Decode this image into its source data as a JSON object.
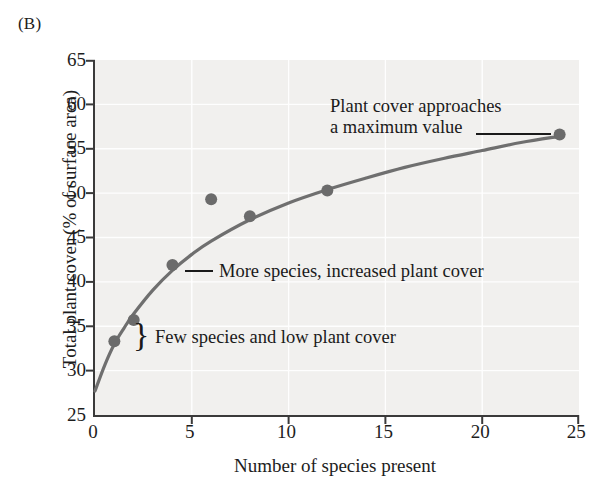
{
  "panel": {
    "label": "(B)"
  },
  "chart_data": {
    "type": "scatter",
    "title": "",
    "xlabel": "Number of species present",
    "ylabel": "Total plant cover (% of surface area)",
    "xlim": [
      0,
      25
    ],
    "ylim": [
      25,
      65
    ],
    "xticks": [
      0,
      5,
      10,
      15,
      20,
      25
    ],
    "yticks": [
      25,
      30,
      35,
      40,
      45,
      50,
      55,
      60,
      65
    ],
    "xtick_labels": [
      "0",
      "5",
      "10",
      "15",
      "20",
      "25"
    ],
    "ytick_labels": [
      "25",
      "30",
      "35",
      "40",
      "45",
      "50",
      "55",
      "60",
      "65"
    ],
    "grid": true,
    "legend": "none",
    "marker_color": "#6b6b6b",
    "line_color": "#6f6f6f",
    "plot_background": "#f1f0ee",
    "axis_color": "#3a3a3a",
    "points": [
      {
        "x": 1,
        "y": 33.3
      },
      {
        "x": 2,
        "y": 35.7
      },
      {
        "x": 4,
        "y": 41.9
      },
      {
        "x": 6,
        "y": 49.3
      },
      {
        "x": 8,
        "y": 47.4
      },
      {
        "x": 12,
        "y": 50.3
      },
      {
        "x": 24,
        "y": 56.6
      }
    ],
    "fit_curve": {
      "description": "saturating asymptotic curve through the data",
      "points": [
        {
          "x": 0.0,
          "y": 27.7
        },
        {
          "x": 0.5,
          "y": 30.6
        },
        {
          "x": 1.0,
          "y": 33.0
        },
        {
          "x": 1.5,
          "y": 34.8
        },
        {
          "x": 2.0,
          "y": 36.4
        },
        {
          "x": 3.0,
          "y": 39.1
        },
        {
          "x": 4.0,
          "y": 41.3
        },
        {
          "x": 5.0,
          "y": 43.1
        },
        {
          "x": 6.0,
          "y": 44.6
        },
        {
          "x": 8.0,
          "y": 47.0
        },
        {
          "x": 10.0,
          "y": 48.9
        },
        {
          "x": 12.0,
          "y": 50.4
        },
        {
          "x": 14.0,
          "y": 51.7
        },
        {
          "x": 16.0,
          "y": 52.9
        },
        {
          "x": 18.0,
          "y": 53.9
        },
        {
          "x": 20.0,
          "y": 54.8
        },
        {
          "x": 22.0,
          "y": 55.7
        },
        {
          "x": 24.0,
          "y": 56.4
        }
      ]
    },
    "annotations": [
      {
        "id": "max",
        "line1": "Plant cover approaches",
        "line2": "a maximum value",
        "target_point": {
          "x": 24,
          "y": 56.6
        },
        "leader": "line"
      },
      {
        "id": "more",
        "text": "More species, increased plant cover",
        "target_point": {
          "x": 4,
          "y": 41.9
        },
        "leader": "line"
      },
      {
        "id": "few",
        "text": "Few species and low plant cover",
        "target_points": [
          {
            "x": 1,
            "y": 33.3
          },
          {
            "x": 2,
            "y": 35.7
          }
        ],
        "leader": "brace",
        "brace_glyph": "}"
      }
    ]
  }
}
